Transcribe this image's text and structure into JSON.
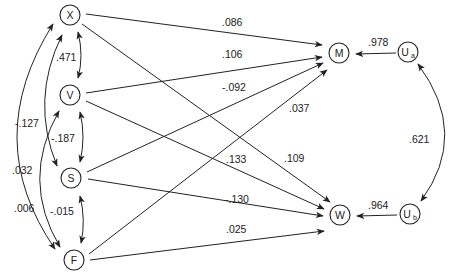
{
  "diagram": {
    "type": "path-diagram",
    "nodes": [
      {
        "id": "X",
        "label": "X",
        "x": 70,
        "y": 15
      },
      {
        "id": "V",
        "label": "V",
        "x": 70,
        "y": 95
      },
      {
        "id": "S",
        "label": "S",
        "x": 71,
        "y": 178
      },
      {
        "id": "F",
        "label": "F",
        "x": 74,
        "y": 260
      },
      {
        "id": "M",
        "label": "M",
        "x": 339,
        "y": 53
      },
      {
        "id": "W",
        "label": "W",
        "x": 340,
        "y": 215
      },
      {
        "id": "Ua",
        "label": "U",
        "sub": "a",
        "x": 408,
        "y": 52
      },
      {
        "id": "Ub",
        "label": "U",
        "sub": "b",
        "x": 410,
        "y": 214
      }
    ],
    "paths": [
      {
        "from": "X",
        "to": "M",
        "coef": ".086"
      },
      {
        "from": "V",
        "to": "M",
        "coef": ".106"
      },
      {
        "from": "S",
        "to": "M",
        "coef": "-.092"
      },
      {
        "from": "F",
        "to": "M",
        "coef": ".037"
      },
      {
        "from": "X",
        "to": "W",
        "coef": ".109"
      },
      {
        "from": "V",
        "to": "W",
        "coef": ".133"
      },
      {
        "from": "S",
        "to": "W",
        "coef": "-.130"
      },
      {
        "from": "F",
        "to": "W",
        "coef": ".025"
      },
      {
        "from": "Ua",
        "to": "M",
        "coef": ".978"
      },
      {
        "from": "Ub",
        "to": "W",
        "coef": ".964"
      }
    ],
    "correlations": [
      {
        "a": "X",
        "b": "V",
        "coef": ".471"
      },
      {
        "a": "X",
        "b": "S",
        "coef": "-.127"
      },
      {
        "a": "X",
        "b": "F",
        "coef": ".032"
      },
      {
        "a": "V",
        "b": "S",
        "coef": "-.187"
      },
      {
        "a": "V",
        "b": "F",
        "coef": ".006"
      },
      {
        "a": "S",
        "b": "F",
        "coef": "-.015"
      },
      {
        "a": "Ua",
        "b": "Ub",
        "coef": ".621"
      }
    ]
  }
}
